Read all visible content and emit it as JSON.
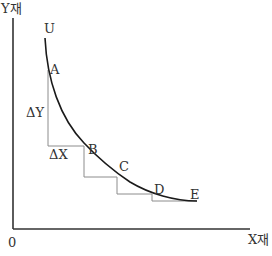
{
  "diagram": {
    "axes": {
      "y_label": "Y재",
      "x_label": "X재",
      "origin_label": "0"
    },
    "curve": {
      "name": "U",
      "points": [
        {
          "label": "A"
        },
        {
          "label": "B"
        },
        {
          "label": "C"
        },
        {
          "label": "D"
        },
        {
          "label": "E"
        }
      ]
    },
    "annotations": {
      "delta_y": "ΔY",
      "delta_x": "ΔX"
    },
    "colors": {
      "axis": "#333333",
      "curve": "#1a1a1a",
      "steps": "#8c8c8c",
      "text": "#333333"
    }
  }
}
